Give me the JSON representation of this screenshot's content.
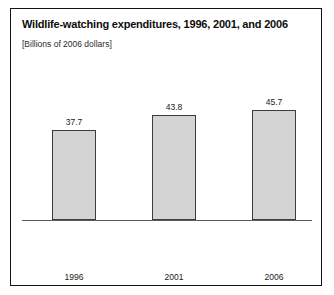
{
  "chart_data": {
    "type": "bar",
    "title": "Wildlife-watching expenditures, 1996, 2001, and 2006",
    "subtitle": "[Billions of 2006 dollars]",
    "xlabel": "",
    "ylabel": "",
    "categories": [
      "1996",
      "2001",
      "2006"
    ],
    "values": [
      37.7,
      43.8,
      45.7
    ],
    "value_labels": [
      "37.7",
      "43.8",
      "45.7"
    ],
    "ylim": [
      0,
      68
    ],
    "grid": false,
    "legend": false,
    "colors": {
      "bar_fill": "#d4d4d4",
      "bar_border": "#3c3c3c",
      "axis": "#5a5a5a",
      "frame": "#141414",
      "text": "#1a1a1a"
    }
  }
}
